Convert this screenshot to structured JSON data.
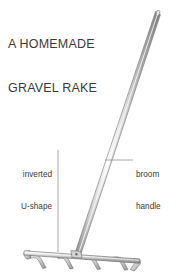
{
  "figure": {
    "title_line1": "A HOMEMADE",
    "title_line2": "GRAVEL RAKE",
    "background_color": "#ffffff",
    "text_color": "#3b3b3b",
    "leader_line_color": "#8c8c8c",
    "metal_light": "#f2f2f2",
    "metal_mid": "#c9c9c9",
    "metal_dark": "#6e6e6e",
    "outline_color": "#5a5a5a",
    "callouts": [
      {
        "id": "inverted-u-shape",
        "line1": "inverted",
        "line2": "U-shape",
        "align": "right",
        "leader": "vertical"
      },
      {
        "id": "broom-handle",
        "line1": "broom",
        "line2": "handle",
        "align": "left",
        "leader": "horizontal"
      }
    ],
    "object": {
      "name": "gravel rake",
      "handle": {
        "top": [
          158,
          12
        ],
        "bottom": [
          76,
          253
        ]
      },
      "head": {
        "left": [
          24,
          251
        ],
        "right": [
          140,
          262
        ],
        "tine_count": 4
      }
    }
  }
}
